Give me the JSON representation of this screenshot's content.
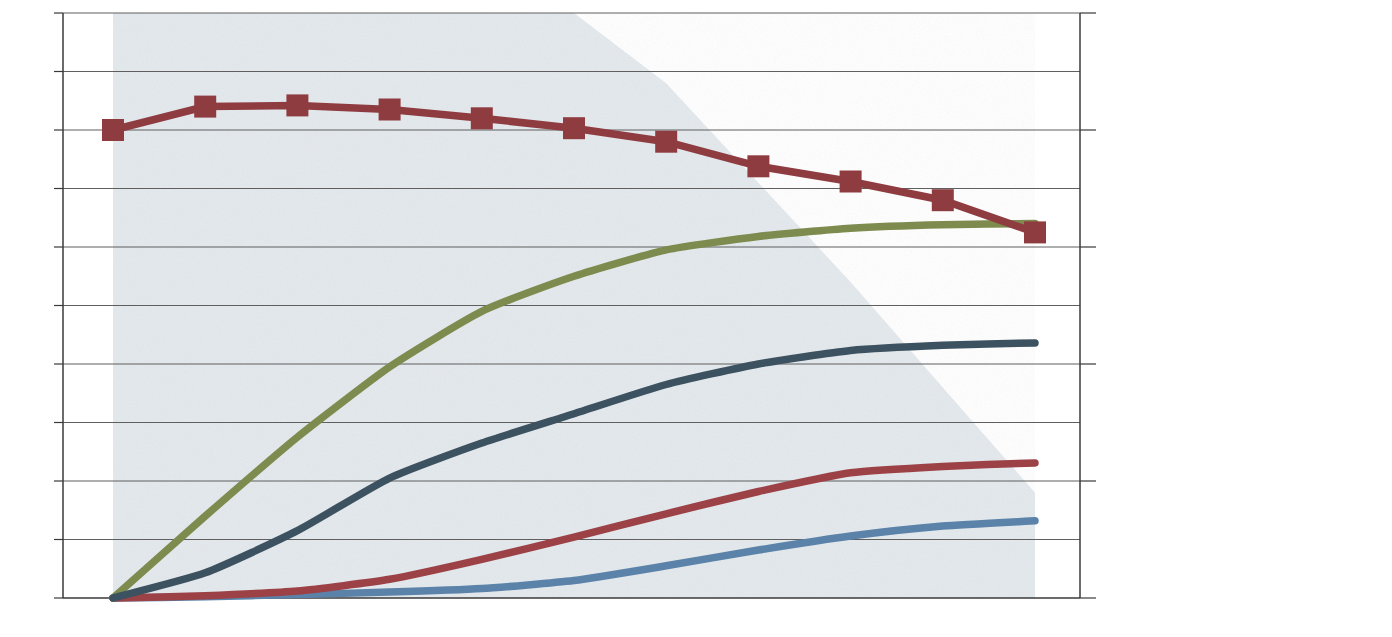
{
  "chart_data": {
    "type": "line",
    "title": "",
    "xlabel": "",
    "ylabel": "",
    "categories": [
      "0.0Y",
      "2.5Y",
      "5.1Y",
      "7.7Y",
      "10.2Y",
      "12.8Y",
      "15.4Y",
      "18.0Y",
      "20.6Y",
      "23.2Y",
      "25.8Y"
    ],
    "x_tick_labels": [
      "0.0Y",
      "2.5Y",
      "5.1Y",
      "7.7Y",
      "10.2Y",
      "12.8Y",
      "15.4Y",
      "18.0Y",
      "20.6Y",
      "23.2Y",
      "25.8Y"
    ],
    "y_left_ticks": [
      "0%",
      "10%",
      "20%",
      "30%",
      "40%",
      "50%",
      "60%",
      "70%",
      "80%",
      "90%",
      "100%"
    ],
    "y_left_values": [
      0,
      10,
      20,
      30,
      40,
      50,
      60,
      70,
      80,
      90,
      100
    ],
    "ylim": [
      0,
      100
    ],
    "y_right_ticks": [
      "$0",
      "$500,000",
      "$1,000,000",
      "$1,500,000",
      "$2,000,000",
      "$2,500,000"
    ],
    "y_right_values": [
      0,
      500000,
      1000000,
      1500000,
      2000000,
      2500000
    ],
    "y2lim": [
      0,
      2500000
    ],
    "grid": true,
    "legend_position": "right",
    "series": [
      {
        "name": "% Survival",
        "kind": "area",
        "axis": "left",
        "color": "#e3e8ec",
        "values": [
          100,
          100,
          100,
          100,
          100,
          100,
          88,
          71,
          54,
          36,
          18
        ]
      },
      {
        "name": "Income < $7,500 per Month",
        "kind": "line",
        "axis": "left",
        "color": "#5b82a8",
        "values": [
          0.0,
          0.2,
          0.6,
          1.0,
          1.6,
          3.0,
          5.5,
          8.2,
          10.6,
          12.3,
          13.2
        ]
      },
      {
        "name": "Portfolio falls below $500K",
        "kind": "line",
        "axis": "left",
        "color": "#9c4247",
        "values": [
          0.0,
          0.4,
          1.2,
          3.2,
          6.6,
          10.4,
          14.4,
          18.2,
          21.4,
          22.5,
          23.1
        ]
      },
      {
        "name": "Portfolio < 20% any 12 Months",
        "kind": "line",
        "axis": "left",
        "color": "#7d8c4e",
        "values": [
          0.0,
          14.0,
          27.5,
          39.5,
          49.0,
          55.0,
          59.5,
          61.8,
          63.2,
          63.8,
          64.0
        ]
      },
      {
        "name": "Portfolio falls > 40% Peak to Trough",
        "kind": "line",
        "axis": "left",
        "color": "#3d5260",
        "values": [
          0.0,
          4.3,
          11.5,
          20.5,
          26.5,
          31.5,
          36.5,
          40.0,
          42.3,
          43.2,
          43.6
        ]
      },
      {
        "name": "Portfolio Value [$7,500]",
        "kind": "line-marker",
        "axis": "right",
        "color": "#8f3c41",
        "values_pct": [
          80.0,
          84.0,
          84.2,
          83.5,
          82.0,
          80.3,
          78.0,
          73.8,
          71.2,
          68.0,
          62.5
        ],
        "values": [
          2000000,
          2100000,
          2105000,
          2087500,
          2050000,
          2007500,
          1950000,
          1845000,
          1780000,
          1700000,
          1562500
        ]
      }
    ]
  },
  "axes": {
    "left_ticks": [
      "100%",
      "90%",
      "80%",
      "70%",
      "60%",
      "50%",
      "40%",
      "30%",
      "20%",
      "10%",
      "0%"
    ],
    "right_ticks": [
      "$2,500,000",
      "$2,000,000",
      "$1,500,000",
      "$1,000,000",
      "$500,000",
      "$0"
    ],
    "x_ticks": [
      "0.0Y",
      "2.5Y",
      "5.1Y",
      "7.7Y",
      "10.2Y",
      "12.8Y",
      "15.4Y",
      "18.0Y",
      "20.6Y",
      "23.2Y",
      "25.8Y"
    ]
  },
  "legend": {
    "items": [
      {
        "name": "survival",
        "swatch": "area",
        "color": "#e3e8ec",
        "lines": [
          "% Survival"
        ]
      },
      {
        "name": "income",
        "swatch": "line",
        "color": "#5b82a8",
        "lines": [
          "Income",
          "< $7,500",
          "per Month"
        ]
      },
      {
        "name": "portfolio-below-500k",
        "swatch": "line",
        "color": "#9c4247",
        "lines": [
          "Portfolio",
          "falls below",
          "$500K"
        ]
      },
      {
        "name": "portfolio-under-20-pct",
        "swatch": "line",
        "color": "#7d8c4e",
        "lines": [
          "Portfolio",
          "< 20% any",
          "12 Months"
        ]
      },
      {
        "name": "portfolio-peak-to-trough",
        "swatch": "line",
        "color": "#3d5260",
        "lines": [
          "Portfolio falls",
          "> 40% Peak",
          "to Trough"
        ]
      },
      {
        "name": "portfolio-value",
        "swatch": "marker",
        "color": "#8f3c41",
        "lines": [
          "Portfolio",
          "Value",
          "[$7,500]"
        ]
      }
    ]
  },
  "colors": {
    "survival_area": "#e3e8ec",
    "income": "#5b82a8",
    "below_500k": "#9c4247",
    "under_20pct": "#7d8c4e",
    "peak_to_trough": "#3d5260",
    "portfolio_value": "#8f3c41",
    "axis": "#3a3a3a",
    "grid": "#5a5a5a",
    "text": "#1c1c1c"
  }
}
